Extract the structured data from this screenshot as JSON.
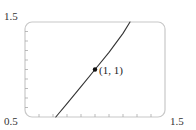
{
  "chart_data": {
    "type": "line",
    "title": "",
    "xlabel": "",
    "ylabel": "",
    "xlim": [
      0.5,
      1.5
    ],
    "ylim": [
      0.5,
      1.5
    ],
    "grid": false,
    "legend": null,
    "tick_labels": {
      "x_min": "0.5",
      "x_max": "1.5",
      "y_max": "1.5"
    },
    "x_ticks": [
      0.6,
      0.7,
      0.8,
      0.9,
      1.0,
      1.1,
      1.2,
      1.3,
      1.4
    ],
    "y_ticks": [
      0.6,
      0.7,
      0.8,
      0.9,
      1.0,
      1.1,
      1.2,
      1.3,
      1.4
    ],
    "series": [
      {
        "name": "curve",
        "color": "#333333",
        "x": [
          0.72,
          0.8,
          0.9,
          1.0,
          1.1,
          1.2,
          1.25
        ],
        "y": [
          0.5,
          0.64,
          0.82,
          1.0,
          1.18,
          1.38,
          1.5
        ]
      }
    ],
    "annotations": [
      {
        "text": "(1, 1)",
        "x": 1.0,
        "y": 1.0,
        "marker": "point"
      }
    ]
  },
  "colors": {
    "frame": "#c8c8c8",
    "curve": "#333333",
    "text": "#333333"
  }
}
